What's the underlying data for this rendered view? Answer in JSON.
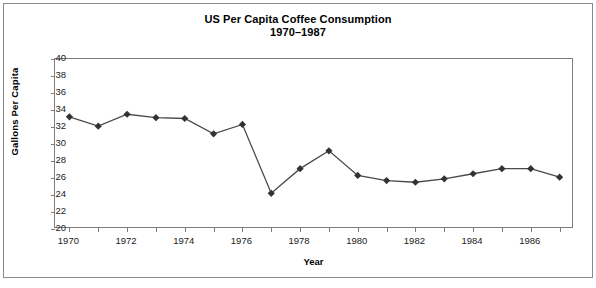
{
  "chart_data": {
    "type": "line",
    "title": "US Per Capita Coffee Consumption",
    "subtitle": "1970–1987",
    "xlabel": "Year",
    "ylabel": "Gallons Per Capita",
    "x": [
      1970,
      1971,
      1972,
      1973,
      1974,
      1975,
      1976,
      1977,
      1978,
      1979,
      1980,
      1981,
      1982,
      1983,
      1984,
      1985,
      1986,
      1987
    ],
    "values": [
      33.2,
      32.1,
      33.5,
      33.1,
      33.0,
      31.2,
      32.3,
      24.2,
      27.1,
      29.2,
      26.3,
      25.7,
      25.5,
      25.9,
      26.5,
      27.1,
      27.1,
      26.1
    ],
    "series": [
      {
        "name": "US Per Capita Coffee Consumption",
        "values": [
          33.2,
          32.1,
          33.5,
          33.1,
          33.0,
          31.2,
          32.3,
          24.2,
          27.1,
          29.2,
          26.3,
          25.7,
          25.5,
          25.9,
          26.5,
          27.1,
          27.1,
          26.1
        ]
      }
    ],
    "ylim": [
      20,
      40
    ],
    "xlim": [
      1969.5,
      1987.5
    ],
    "ytick_labels": [
      "20",
      "22",
      "24",
      "26",
      "28",
      "30",
      "32",
      "34",
      "36",
      "38",
      "40"
    ],
    "ytick_values": [
      20,
      22,
      24,
      26,
      28,
      30,
      32,
      34,
      36,
      38,
      40
    ],
    "xtick_values": [
      1970,
      1971,
      1972,
      1973,
      1974,
      1975,
      1976,
      1977,
      1978,
      1979,
      1980,
      1981,
      1982,
      1983,
      1984,
      1985,
      1986,
      1987
    ],
    "xtick_labels": [
      "1970",
      "",
      "1972",
      "",
      "1974",
      "",
      "1976",
      "",
      "1978",
      "",
      "1980",
      "",
      "1982",
      "",
      "1984",
      "",
      "1986",
      ""
    ],
    "grid": false,
    "legend": null,
    "marker": "diamond",
    "line_color": "#4a4a4a",
    "marker_color": "#333333",
    "axis_color": "#7d7d7d",
    "frame_color": "#8a8a8a",
    "background": "#ffffff"
  }
}
